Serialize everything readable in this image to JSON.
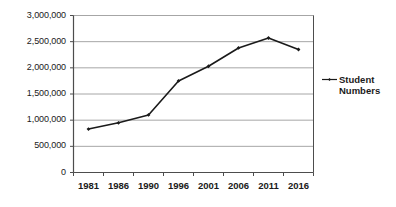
{
  "chart_data": {
    "type": "line",
    "title": "",
    "xlabel": "",
    "ylabel": "",
    "categories": [
      "1981",
      "1986",
      "1990",
      "1996",
      "2001",
      "2006",
      "2011",
      "2016"
    ],
    "series": [
      {
        "name": "Student Numbers",
        "values": [
          830000,
          950000,
          1100000,
          1750000,
          2030000,
          2380000,
          2570000,
          2350000
        ]
      }
    ],
    "ylim": [
      0,
      3000000
    ],
    "yticks": [
      0,
      500000,
      1000000,
      1500000,
      2000000,
      2500000,
      3000000
    ],
    "ytick_labels": [
      "0",
      "500,000",
      "1,000,000",
      "1,500,000",
      "2,000,000",
      "2,500,000",
      "3,000,000"
    ],
    "grid": true,
    "grid_axis": "y",
    "legend_position": "right",
    "legend_entries": [
      "Student Numbers"
    ],
    "marker": "diamond",
    "line_color": "#1a1a1a",
    "grid_color": "#a6a6a6",
    "axis_color": "#4d4d4d",
    "plot_background": "#ffffff"
  },
  "legend": {
    "line1": "Student",
    "line2": "Numbers"
  }
}
